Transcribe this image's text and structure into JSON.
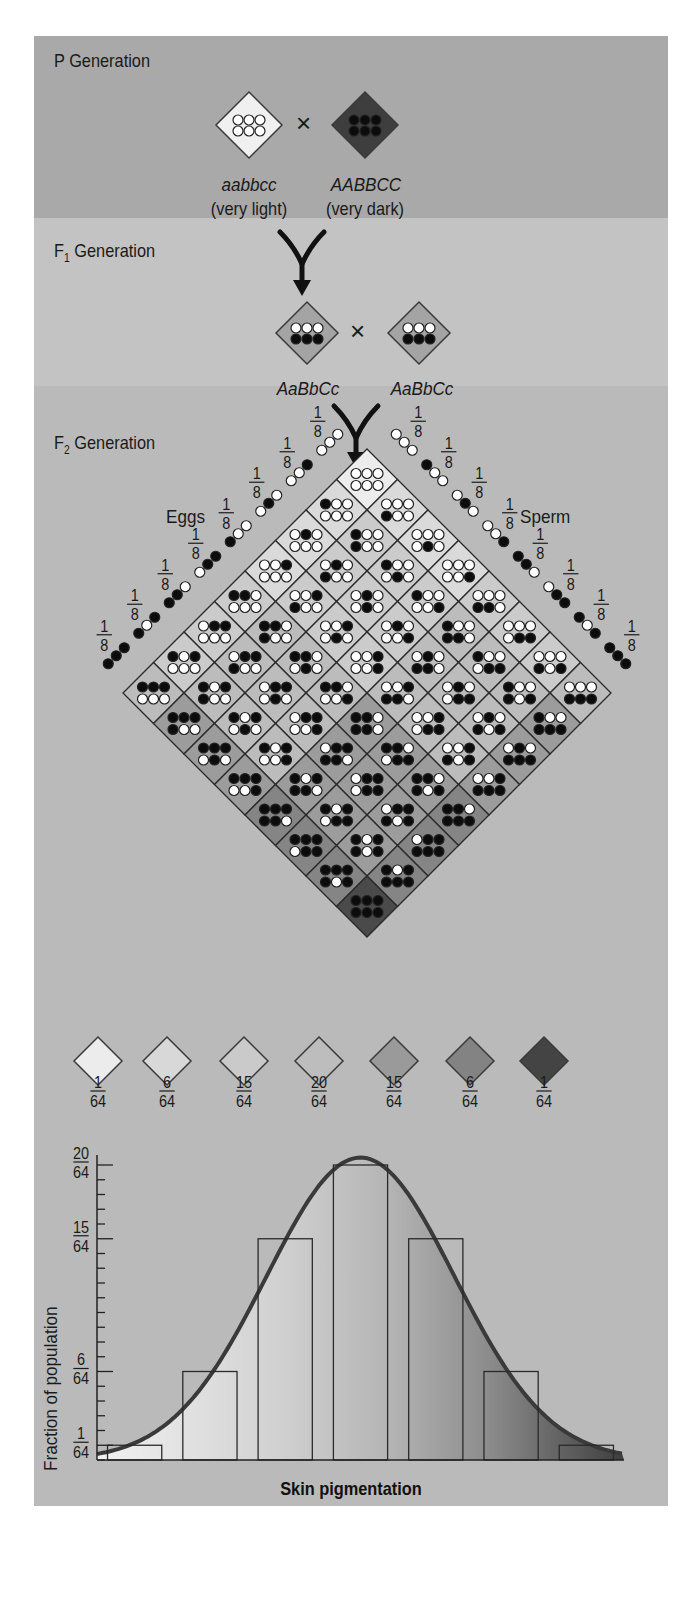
{
  "p_generation": {
    "label": "P Generation",
    "parent_left": {
      "genotype": "aabbcc",
      "phenotype": "(very light)",
      "dots": [
        0,
        0,
        0,
        0,
        0,
        0
      ],
      "color": "#f0f0f0"
    },
    "cross_symbol": "×",
    "parent_right": {
      "genotype": "AABBCC",
      "phenotype": "(very dark)",
      "dots": [
        1,
        1,
        1,
        1,
        1,
        1
      ],
      "color": "#3e3e3e"
    }
  },
  "f1_generation": {
    "label_prefix": "F",
    "label_sub": "1",
    "label_suffix": " Generation",
    "parent_left": {
      "genotype": "AaBbCc",
      "dots_top": [
        0,
        0,
        0
      ],
      "dots_bottom": [
        1,
        1,
        1
      ],
      "color": "#a4a4a4"
    },
    "cross_symbol": "×",
    "parent_right": {
      "genotype": "AaBbCc",
      "dots_top": [
        0,
        0,
        0
      ],
      "dots_bottom": [
        1,
        1,
        1
      ],
      "color": "#a4a4a4"
    }
  },
  "f2_generation": {
    "label_prefix": "F",
    "label_sub": "2",
    "label_suffix": " Generation",
    "eggs_label": "Eggs",
    "sperm_label": "Sperm",
    "gamete_fraction": {
      "numerator": "1",
      "denominator": "8"
    },
    "egg_gametes": [
      [
        0,
        0,
        0
      ],
      [
        1,
        0,
        0
      ],
      [
        0,
        1,
        0
      ],
      [
        0,
        0,
        1
      ],
      [
        1,
        1,
        0
      ],
      [
        0,
        1,
        1
      ],
      [
        1,
        0,
        1
      ],
      [
        1,
        1,
        1
      ]
    ],
    "sperm_gametes": [
      [
        0,
        0,
        0
      ],
      [
        1,
        0,
        0
      ],
      [
        0,
        1,
        0
      ],
      [
        0,
        0,
        1
      ],
      [
        1,
        1,
        0
      ],
      [
        0,
        1,
        1
      ],
      [
        1,
        0,
        1
      ],
      [
        1,
        1,
        1
      ]
    ],
    "shade_colors": [
      "#ececec",
      "#dadada",
      "#cbcbcb",
      "#bcbcbc",
      "#9c9c9c",
      "#858585",
      "#4a4a4a"
    ]
  },
  "phenotype_key": [
    {
      "numerator": "1",
      "denominator": "64",
      "color": "#ececec"
    },
    {
      "numerator": "6",
      "denominator": "64",
      "color": "#d8d8d8"
    },
    {
      "numerator": "15",
      "denominator": "64",
      "color": "#cacaca"
    },
    {
      "numerator": "20",
      "denominator": "64",
      "color": "#bdbdbd"
    },
    {
      "numerator": "15",
      "denominator": "64",
      "color": "#9a9a9a"
    },
    {
      "numerator": "6",
      "denominator": "64",
      "color": "#838383"
    },
    {
      "numerator": "1",
      "denominator": "64",
      "color": "#444444"
    }
  ],
  "chart_data": {
    "type": "bar",
    "title": "",
    "xlabel": "Skin pigmentation",
    "ylabel": "Fraction of population",
    "categories": [
      "0 dominant alleles",
      "1",
      "2",
      "3",
      "4",
      "5",
      "6 dominant alleles"
    ],
    "values": [
      1,
      6,
      15,
      20,
      15,
      6,
      1
    ],
    "value_unit": "/64",
    "y_tick_labels": [
      {
        "value": 1,
        "label_num": "1",
        "label_den": "64"
      },
      {
        "value": 6,
        "label_num": "6",
        "label_den": "64"
      },
      {
        "value": 15,
        "label_num": "15",
        "label_den": "64"
      },
      {
        "value": 20,
        "label_num": "20",
        "label_den": "64"
      }
    ],
    "ylim": [
      0,
      20
    ],
    "y_minor_ticks_step": 1,
    "overlay": "normal distribution curve",
    "grid": false,
    "legend": "none"
  }
}
